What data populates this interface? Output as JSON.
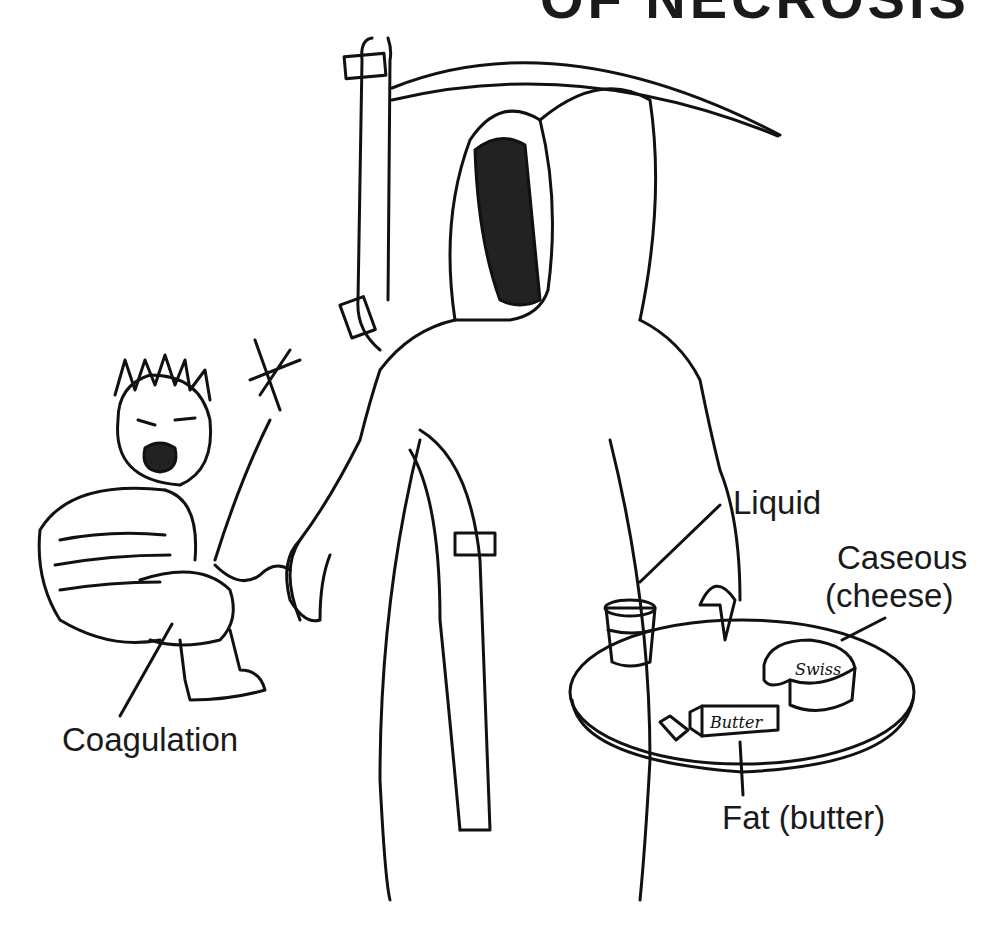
{
  "figure": {
    "title_fragment": "OF NECROSIS",
    "labels": {
      "liquid": "Liquid",
      "caseous_line1": "Caseous",
      "caseous_line2": "(cheese)",
      "coagulation": "Coagulation",
      "fat": "Fat (butter)"
    },
    "object_tags": {
      "butter_box": "Butter",
      "cheese_wheel": "Swiss"
    },
    "characters": [
      "grim-reaper",
      "crying-child"
    ],
    "colors": {
      "ink": "#111111",
      "background": "#ffffff"
    }
  }
}
